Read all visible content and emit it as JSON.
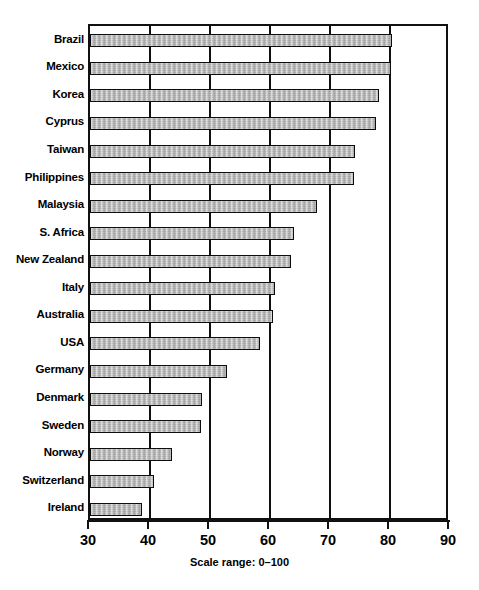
{
  "chart_data": {
    "type": "bar",
    "orientation": "horizontal",
    "title": "",
    "subtitle": "",
    "xlabel": "",
    "ylabel": "",
    "xlim": [
      30,
      90
    ],
    "ylim": null,
    "grid": true,
    "grid_axis": "x",
    "legend": false,
    "legend_position": "none",
    "note": "Scale range: 0–100",
    "xticks": [
      30,
      40,
      50,
      60,
      70,
      80,
      90
    ],
    "xtick_labels": [
      "30",
      "40",
      "50",
      "60",
      "70",
      "80",
      "90"
    ],
    "categories": [
      "Brazil",
      "Mexico",
      "Korea",
      "Cyprus",
      "Taiwan",
      "Philippines",
      "Malaysia",
      "S. Africa",
      "New Zealand",
      "Italy",
      "Australia",
      "USA",
      "Germany",
      "Denmark",
      "Sweden",
      "Norway",
      "Switzerland",
      "Ireland"
    ],
    "values": [
      80.4,
      80.2,
      78.2,
      77.6,
      74.2,
      74.0,
      67.8,
      64.0,
      63.5,
      60.9,
      60.5,
      58.3,
      52.8,
      48.6,
      48.5,
      43.7,
      40.6,
      38.7
    ],
    "bar_fill_color": "#b9b9b9",
    "bar_edge_color": "#0d0d0d",
    "axis_color": "#111111",
    "background_color": "#ffffff"
  },
  "figure": {
    "scale_note": "Scale range: 0–100",
    "caption_fragment": ""
  }
}
